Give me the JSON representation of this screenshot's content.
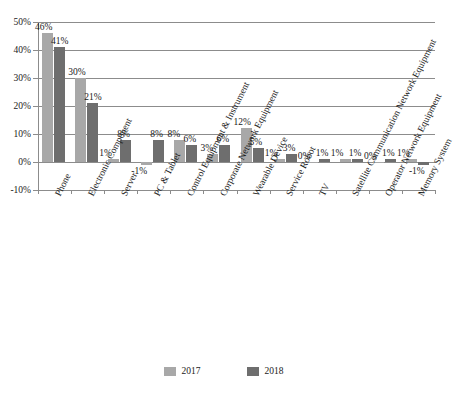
{
  "chart_data": {
    "type": "bar",
    "title": "",
    "xlabel": "",
    "ylabel": "",
    "ylim": [
      -10,
      50
    ],
    "ytick_labels": [
      "50%",
      "40%",
      "30%",
      "20%",
      "10%",
      "0%",
      "-10%"
    ],
    "ytick_values": [
      50,
      40,
      30,
      20,
      10,
      0,
      -10
    ],
    "grid": true,
    "legend_position": "bottom",
    "categories": [
      "Phone",
      "Electronic Component",
      "Server",
      "PC & Tablet",
      "Control Equipment & Instrument",
      "Corporate Network Equipment",
      "Wearable Device",
      "Service Robot",
      "TV",
      "Satellite Communication Network Equipment",
      "Operator Network Equipment",
      "Memory System"
    ],
    "series": [
      {
        "name": "2017",
        "color": "#a8a8a8",
        "values": [
          46,
          30,
          1,
          -1,
          8,
          3,
          12,
          1,
          0,
          1,
          0,
          1
        ],
        "labels": [
          "46%",
          "30%",
          "1%",
          "-1%",
          "8%",
          "3%",
          "12%",
          "1%",
          "0%",
          "1%",
          "0%",
          "1%"
        ]
      },
      {
        "name": "2018",
        "color": "#6e6e6e",
        "values": [
          41,
          21,
          8,
          8,
          6,
          6,
          5,
          3,
          1,
          1,
          1,
          -1
        ],
        "labels": [
          "41%",
          "21%",
          "8%",
          "8%",
          "6%",
          "6%",
          "5%",
          "3%",
          "1%",
          "1%",
          "1%",
          "-1%"
        ]
      }
    ]
  },
  "legend": {
    "items": [
      {
        "label": "2017",
        "color": "#a8a8a8"
      },
      {
        "label": "2018",
        "color": "#6e6e6e"
      }
    ]
  }
}
